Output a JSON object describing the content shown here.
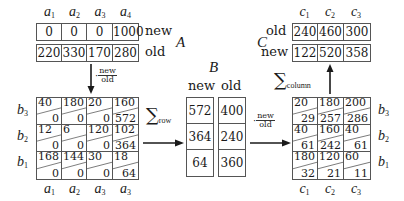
{
  "labels": {
    "A": "A",
    "B": "B",
    "C": "C",
    "new": "new",
    "old": "old",
    "sum_row": "row",
    "sum_column": "column",
    "sigma": "∑",
    "fraction_num": "new",
    "fraction_den": "old",
    "times_dot": "·"
  },
  "A": {
    "columns": [
      {
        "sym": "a",
        "sub": "1"
      },
      {
        "sym": "a",
        "sub": "2"
      },
      {
        "sym": "a",
        "sub": "3"
      },
      {
        "sym": "a",
        "sub": "4"
      }
    ],
    "new": [
      "0",
      "0",
      "0",
      "1000"
    ],
    "old": [
      "220",
      "330",
      "170",
      "280"
    ]
  },
  "matrix_left": {
    "row_labels": [
      {
        "sym": "b",
        "sub": "3"
      },
      {
        "sym": "b",
        "sub": "2"
      },
      {
        "sym": "b",
        "sub": "1"
      }
    ],
    "col_labels": [
      {
        "sym": "a",
        "sub": "1"
      },
      {
        "sym": "a",
        "sub": "2"
      },
      {
        "sym": "a",
        "sub": "3"
      },
      {
        "sym": "a",
        "sub": "3"
      }
    ],
    "rows": [
      [
        {
          "top": "40",
          "bot": "0"
        },
        {
          "top": "180",
          "bot": "0"
        },
        {
          "top": "20",
          "bot": "0"
        },
        {
          "top": "160",
          "bot": "572"
        }
      ],
      [
        {
          "top": "12",
          "bot": "0"
        },
        {
          "top": "6",
          "bot": "0"
        },
        {
          "top": "120",
          "bot": "0"
        },
        {
          "top": "102",
          "bot": "364"
        }
      ],
      [
        {
          "top": "168",
          "bot": "0"
        },
        {
          "top": "144",
          "bot": "0"
        },
        {
          "top": "30",
          "bot": "0"
        },
        {
          "top": "18",
          "bot": "64"
        }
      ]
    ]
  },
  "B": {
    "new": [
      "572",
      "364",
      "64"
    ],
    "old": [
      "400",
      "240",
      "360"
    ]
  },
  "matrix_right": {
    "row_labels": [
      {
        "sym": "b",
        "sub": "3"
      },
      {
        "sym": "b",
        "sub": "2"
      },
      {
        "sym": "b",
        "sub": "1"
      }
    ],
    "col_labels": [
      {
        "sym": "c",
        "sub": "1"
      },
      {
        "sym": "c",
        "sub": "2"
      },
      {
        "sym": "c",
        "sub": "3"
      }
    ],
    "rows": [
      [
        {
          "top": "20",
          "bot": "29"
        },
        {
          "top": "180",
          "bot": "257"
        },
        {
          "top": "200",
          "bot": "286"
        }
      ],
      [
        {
          "top": "40",
          "bot": "61"
        },
        {
          "top": "160",
          "bot": "242"
        },
        {
          "top": "40",
          "bot": "61"
        }
      ],
      [
        {
          "top": "180",
          "bot": "32"
        },
        {
          "top": "120",
          "bot": "21"
        },
        {
          "top": "60",
          "bot": "11"
        }
      ]
    ]
  },
  "C": {
    "columns": [
      {
        "sym": "c",
        "sub": "1"
      },
      {
        "sym": "c",
        "sub": "2"
      },
      {
        "sym": "c",
        "sub": "3"
      }
    ],
    "old": [
      "240",
      "460",
      "300"
    ],
    "new": [
      "122",
      "520",
      "358"
    ]
  }
}
